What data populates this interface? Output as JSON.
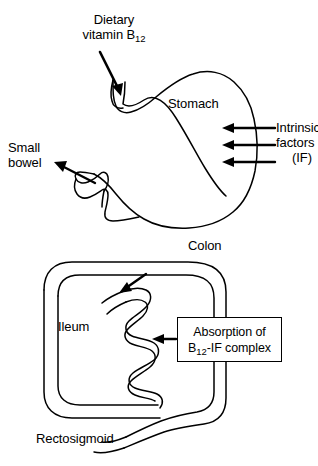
{
  "figure": {
    "background_color": "#ffffff",
    "line_color": "#000000",
    "text_color": "#000000"
  },
  "upper_panel": {
    "name": "stomach-panel",
    "organ_label": "Stomach",
    "input_label_line1": "Dietary",
    "input_label_line2_prefix": "vitamin B",
    "input_label_line2_sub": "12",
    "output_label_line1": "Small",
    "output_label_line2": "bowel",
    "secretion_label_line1": "Intrinsic",
    "secretion_label_line2": "factors",
    "secretion_label_line3": "(IF)",
    "secretion_arrow_count": 3
  },
  "lower_panel": {
    "name": "colon-panel",
    "colon_label": "Colon",
    "ileum_label": "Ileum",
    "rectosigmoid_label": "Rectosigmoid",
    "callout_line1": "Absorption of",
    "callout_line2_prefix": "B",
    "callout_line2_sub": "12",
    "callout_line2_suffix": "-IF complex"
  }
}
